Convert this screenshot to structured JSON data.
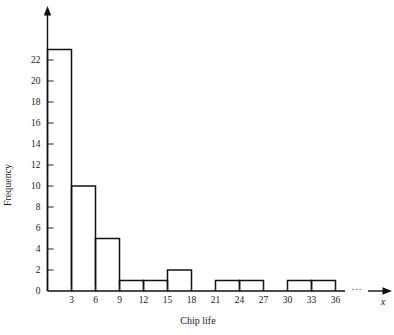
{
  "chart_data": {
    "type": "bar",
    "title": "",
    "subtitle": "",
    "xlabel": "Chip life",
    "ylabel": "Frequency",
    "bin_width": 3,
    "bin_edges": [
      0,
      3,
      6,
      9,
      12,
      15,
      18,
      21,
      24,
      27,
      30,
      33,
      36
    ],
    "categories": [
      "0-3",
      "3-6",
      "6-9",
      "9-12",
      "12-15",
      "15-18",
      "18-21",
      "21-24",
      "24-27",
      "27-30",
      "30-33",
      "33-36"
    ],
    "values": [
      23,
      10,
      5,
      1,
      1,
      2,
      0,
      1,
      1,
      0,
      1,
      1
    ],
    "bars": [
      {
        "left": 0,
        "right": 3,
        "height": 23
      },
      {
        "left": 3,
        "right": 6,
        "height": 10
      },
      {
        "left": 6,
        "right": 9,
        "height": 5
      },
      {
        "left": 9,
        "right": 12,
        "height": 1
      },
      {
        "left": 12,
        "right": 15,
        "height": 1
      },
      {
        "left": 15,
        "right": 18,
        "height": 2
      },
      {
        "left": 18,
        "right": 21,
        "height": 0
      },
      {
        "left": 21,
        "right": 24,
        "height": 1
      },
      {
        "left": 24,
        "right": 27,
        "height": 1
      },
      {
        "left": 27,
        "right": 30,
        "height": 0
      },
      {
        "left": 30,
        "right": 33,
        "height": 1
      },
      {
        "left": 33,
        "right": 36,
        "height": 1
      }
    ],
    "xticks": [
      3,
      6,
      9,
      12,
      15,
      18,
      21,
      24,
      27,
      30,
      33,
      36
    ],
    "xtick_labels": [
      "3",
      "6",
      "9",
      "12",
      "15",
      "18",
      "21",
      "24",
      "27",
      "30",
      "33",
      "36"
    ],
    "yticks": [
      0,
      2,
      4,
      6,
      8,
      10,
      12,
      14,
      16,
      18,
      20,
      22
    ],
    "ytick_labels": [
      "0",
      "2",
      "4",
      "6",
      "8",
      "10",
      "12",
      "14",
      "16",
      "18",
      "20",
      "22"
    ],
    "xlim": [
      0,
      36
    ],
    "ylim": [
      0,
      24
    ],
    "grid": false,
    "legend": false,
    "bar_style": "outline-only",
    "bar_fill": "#ffffff",
    "bar_stroke": "#111111",
    "axis_color": "#111111",
    "background": "#ffffff",
    "axis_variable_label": "x",
    "axis_break_symbol": "⋯",
    "x_axis_has_arrow": true,
    "y_axis_has_arrow": true
  },
  "labels": {
    "ylabel": "Frequency",
    "xlabel": "Chip life",
    "axis_var": "x",
    "break_dots": "⋯"
  }
}
